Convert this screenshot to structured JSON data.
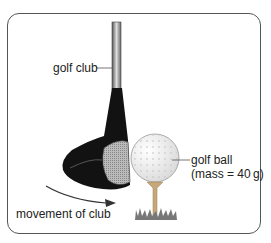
{
  "diagram": {
    "labels": {
      "golf_club": "golf club",
      "golf_ball": "golf ball",
      "ball_mass": "(mass = 40 g)",
      "movement": "movement of club"
    },
    "colors": {
      "border": "#555555",
      "club_head": "#111111",
      "shaft": "#9a9a9a",
      "ball": "#f2f2f2",
      "tee": "#c8a878",
      "grass": "#777777",
      "arrow": "#333333"
    }
  }
}
